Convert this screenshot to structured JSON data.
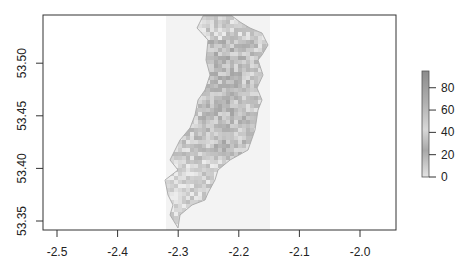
{
  "chart_data": {
    "type": "heatmap",
    "title": "",
    "xlabel": "",
    "ylabel": "",
    "xlim": [
      -2.52,
      -1.94
    ],
    "ylim": [
      53.338,
      53.545
    ],
    "x_ticks": [
      -2.5,
      -2.4,
      -2.3,
      -2.2,
      -2.1,
      -2.0
    ],
    "x_tick_labels": [
      "-2.5",
      "-2.4",
      "-2.3",
      "-2.2",
      "-2.1",
      "-2.0"
    ],
    "y_ticks": [
      53.35,
      53.4,
      53.45,
      53.5
    ],
    "y_tick_labels": [
      "53.35",
      "53.40",
      "53.45",
      "53.50"
    ],
    "raster_extent": {
      "xmin": -2.319,
      "xmax": -2.148,
      "ymin": 53.338,
      "ymax": 53.545
    },
    "colorbar": {
      "range": [
        0,
        95
      ],
      "ticks": [
        0,
        20,
        40,
        60,
        80
      ],
      "tick_labels": [
        "0",
        "20",
        "40",
        "60",
        "80"
      ],
      "colors": {
        "low": "#e8e8e8",
        "high": "#8c8c8c"
      }
    },
    "region_outline": "Manchester boundary polygon (approx. x -2.32 to -2.15, y 53.34 to 53.54)",
    "grid": false,
    "legend_position": "right"
  },
  "colors": {
    "axis": "#333333",
    "raster_background": "#f3f3f3",
    "outline": "#a8a8a8",
    "cell_low": "#ececec",
    "cell_high": "#8a8a8a"
  }
}
